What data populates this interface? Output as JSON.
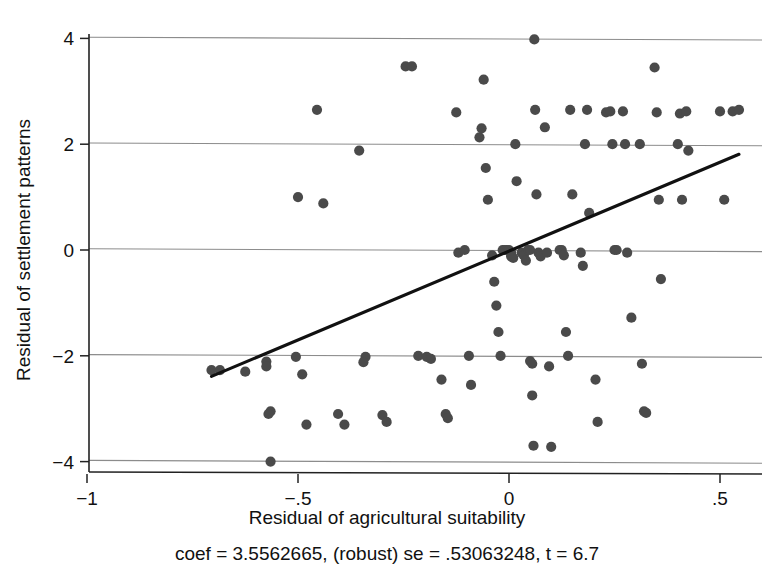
{
  "chart_data": {
    "type": "scatter",
    "title": "",
    "xlabel": "Residual of agricultural suitability",
    "ylabel": "Residual of settlement patterns",
    "caption": "coef = 3.5562665, (robust) se = .53063248, t = 6.7",
    "xlim": [
      -1.08,
      0.6
    ],
    "ylim": [
      -4.35,
      4.3
    ],
    "xticks": [
      -1,
      -0.5,
      0,
      0.5
    ],
    "xtick_labels": [
      "-1",
      "-.5",
      "0",
      ".5"
    ],
    "yticks": [
      -4,
      -2,
      0,
      2,
      4
    ],
    "ytick_labels": [
      "-4",
      "-2",
      "0",
      "2",
      "4"
    ],
    "grid": "horizontal",
    "legend": "none",
    "marker_color": "#4a4a4a",
    "line_color": "#111111",
    "fit_line": {
      "label": "linear fit",
      "coef": 3.5562665,
      "se": 0.53063248,
      "t": 6.7,
      "x_start": -0.705,
      "y_start": -2.39,
      "x_end": 0.545,
      "y_end": 1.81
    },
    "points": [
      [
        -0.705,
        -2.27
      ],
      [
        -0.685,
        -2.27
      ],
      [
        -0.625,
        -2.3
      ],
      [
        -0.575,
        -2.11
      ],
      [
        -0.575,
        -2.2
      ],
      [
        -0.565,
        -3.05
      ],
      [
        -0.57,
        -3.1
      ],
      [
        -0.565,
        -4.0
      ],
      [
        -0.5,
        1.0
      ],
      [
        -0.505,
        -2.02
      ],
      [
        -0.49,
        -2.35
      ],
      [
        -0.48,
        -3.3
      ],
      [
        -0.455,
        2.65
      ],
      [
        -0.44,
        0.88
      ],
      [
        -0.405,
        -3.1
      ],
      [
        -0.39,
        -3.3
      ],
      [
        -0.355,
        1.88
      ],
      [
        -0.34,
        -2.02
      ],
      [
        -0.345,
        -2.12
      ],
      [
        -0.3,
        -3.12
      ],
      [
        -0.29,
        -3.25
      ],
      [
        -0.245,
        3.47
      ],
      [
        -0.23,
        3.47
      ],
      [
        -0.215,
        -2.0
      ],
      [
        -0.195,
        -2.02
      ],
      [
        -0.185,
        -2.06
      ],
      [
        -0.16,
        -2.45
      ],
      [
        -0.15,
        -3.1
      ],
      [
        -0.145,
        -3.18
      ],
      [
        -0.125,
        2.6
      ],
      [
        -0.12,
        -0.05
      ],
      [
        -0.105,
        0.0
      ],
      [
        -0.095,
        -2.0
      ],
      [
        -0.09,
        -2.55
      ],
      [
        -0.07,
        2.13
      ],
      [
        -0.065,
        2.3
      ],
      [
        -0.06,
        3.22
      ],
      [
        -0.055,
        1.55
      ],
      [
        -0.05,
        0.95
      ],
      [
        -0.04,
        -0.1
      ],
      [
        -0.035,
        -0.6
      ],
      [
        -0.03,
        -1.05
      ],
      [
        -0.025,
        -1.55
      ],
      [
        -0.02,
        -2.0
      ],
      [
        -0.015,
        0.0
      ],
      [
        -0.01,
        0.0
      ],
      [
        -0.005,
        0.0
      ],
      [
        0.0,
        0.0
      ],
      [
        0.005,
        -0.05
      ],
      [
        0.005,
        -0.12
      ],
      [
        0.01,
        -0.15
      ],
      [
        0.015,
        2.0
      ],
      [
        0.018,
        1.3
      ],
      [
        0.03,
        -0.05
      ],
      [
        0.035,
        -0.1
      ],
      [
        0.04,
        -0.2
      ],
      [
        0.045,
        0.0
      ],
      [
        0.05,
        0.0
      ],
      [
        0.05,
        -2.1
      ],
      [
        0.055,
        -2.15
      ],
      [
        0.055,
        -2.75
      ],
      [
        0.058,
        -3.7
      ],
      [
        0.06,
        3.98
      ],
      [
        0.062,
        2.65
      ],
      [
        0.065,
        1.05
      ],
      [
        0.07,
        -0.05
      ],
      [
        0.075,
        -0.12
      ],
      [
        0.085,
        2.32
      ],
      [
        0.09,
        -0.05
      ],
      [
        0.095,
        -2.2
      ],
      [
        0.1,
        -3.72
      ],
      [
        0.12,
        0.0
      ],
      [
        0.125,
        0.0
      ],
      [
        0.13,
        -0.1
      ],
      [
        0.135,
        -1.55
      ],
      [
        0.14,
        -2.0
      ],
      [
        0.145,
        2.65
      ],
      [
        0.15,
        1.05
      ],
      [
        0.17,
        -0.05
      ],
      [
        0.175,
        -0.3
      ],
      [
        0.18,
        2.0
      ],
      [
        0.185,
        2.65
      ],
      [
        0.19,
        0.7
      ],
      [
        0.205,
        -2.45
      ],
      [
        0.21,
        -3.25
      ],
      [
        0.23,
        2.6
      ],
      [
        0.24,
        2.62
      ],
      [
        0.245,
        2.0
      ],
      [
        0.25,
        0.0
      ],
      [
        0.255,
        0.0
      ],
      [
        0.27,
        2.62
      ],
      [
        0.275,
        2.0
      ],
      [
        0.28,
        -0.05
      ],
      [
        0.29,
        -1.28
      ],
      [
        0.31,
        2.0
      ],
      [
        0.315,
        -2.15
      ],
      [
        0.32,
        -3.05
      ],
      [
        0.325,
        -3.08
      ],
      [
        0.345,
        3.45
      ],
      [
        0.35,
        2.6
      ],
      [
        0.355,
        0.95
      ],
      [
        0.36,
        -0.55
      ],
      [
        0.4,
        2.0
      ],
      [
        0.405,
        2.58
      ],
      [
        0.41,
        0.95
      ],
      [
        0.42,
        2.62
      ],
      [
        0.425,
        1.88
      ],
      [
        0.5,
        2.62
      ],
      [
        0.51,
        0.95
      ],
      [
        0.53,
        2.62
      ],
      [
        0.545,
        2.65
      ]
    ]
  }
}
